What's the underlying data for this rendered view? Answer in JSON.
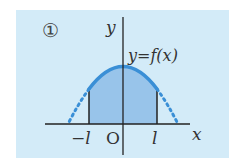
{
  "figure": {
    "label": "①",
    "y_axis_label": "y",
    "x_axis_label": "x",
    "origin_label": "O",
    "neg_bound_label": "−l",
    "pos_bound_label": "l",
    "curve_label": "y=f(x)"
  },
  "colors": {
    "panel_bg": "#d3ebf8",
    "curve": "#3a8fd6",
    "shade": "#8dbde8",
    "axis": "#222222",
    "text": "#333333"
  }
}
